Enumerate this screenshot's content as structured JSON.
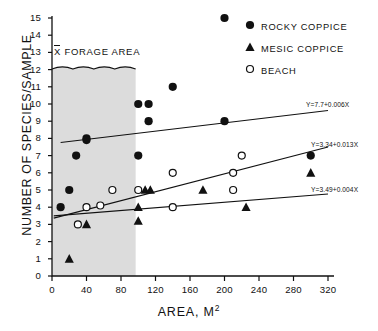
{
  "chart_data": {
    "type": "scatter",
    "title": "",
    "xlabel": "AREA, M2",
    "xlabel_base": "AREA, M",
    "xlabel_exp": "2",
    "ylabel": "NUMBER OF SPECIES/SAMPLE",
    "xlim": [
      0,
      320
    ],
    "ylim": [
      0,
      15
    ],
    "xticks": [
      0,
      40,
      80,
      120,
      160,
      200,
      240,
      280,
      320
    ],
    "yticks": [
      0,
      1,
      2,
      3,
      4,
      5,
      6,
      7,
      8,
      9,
      10,
      11,
      12,
      13,
      14,
      15
    ],
    "grid": false,
    "legend_position": "top-right",
    "series": [
      {
        "name": "ROCKY COPPICE",
        "marker": "filled-circle",
        "color": "#111111",
        "points": [
          [
            10,
            4
          ],
          [
            20,
            5
          ],
          [
            28,
            7
          ],
          [
            40,
            8
          ],
          [
            40,
            7.9
          ],
          [
            100,
            10
          ],
          [
            112,
            10
          ],
          [
            112,
            9
          ],
          [
            100,
            7
          ],
          [
            140,
            11
          ],
          [
            200,
            15
          ],
          [
            200,
            9
          ],
          [
            300,
            7
          ]
        ]
      },
      {
        "name": "MESIC COPPICE",
        "marker": "filled-triangle",
        "color": "#111111",
        "points": [
          [
            20,
            1
          ],
          [
            40,
            3
          ],
          [
            100,
            3.2
          ],
          [
            100,
            4
          ],
          [
            108,
            5
          ],
          [
            114,
            5
          ],
          [
            175,
            5
          ],
          [
            225,
            4
          ],
          [
            300,
            6
          ]
        ]
      },
      {
        "name": "BEACH",
        "marker": "open-circle",
        "color": "#111111",
        "points": [
          [
            30,
            3
          ],
          [
            40,
            4
          ],
          [
            56,
            4.1
          ],
          [
            70,
            5
          ],
          [
            100,
            5
          ],
          [
            140,
            6
          ],
          [
            140,
            4
          ],
          [
            210,
            6
          ],
          [
            210,
            5
          ],
          [
            220,
            7
          ]
        ]
      }
    ],
    "fits": [
      {
        "label": "Y=7.7+0.006X",
        "series": "ROCKY COPPICE",
        "intercept": 7.7,
        "slope": 0.006,
        "x_start": 10,
        "x_end": 320
      },
      {
        "label": "Y=3.34+0.013X",
        "series": "BEACH",
        "intercept": 3.34,
        "slope": 0.013,
        "x_start": 2,
        "x_end": 320
      },
      {
        "label": "Y=3.49+0.004X",
        "series": "MESIC COPPICE",
        "intercept": 3.49,
        "slope": 0.004,
        "x_start": 2,
        "x_end": 320
      }
    ],
    "annotations": [
      {
        "name": "forage-area",
        "text_mean": "X",
        "text": "FORAGE AREA",
        "x_start": 0,
        "x_end": 97,
        "y_top": 12.1,
        "shade_color": "#dcdcdc"
      }
    ]
  },
  "legend": {
    "items": [
      {
        "label": "ROCKY COPPICE",
        "marker": "filled-circle"
      },
      {
        "label": "MESIC COPPICE",
        "marker": "filled-triangle"
      },
      {
        "label": "BEACH",
        "marker": "open-circle"
      }
    ]
  }
}
